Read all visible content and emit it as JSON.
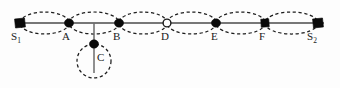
{
  "figure": {
    "background_color": "#fdfdfd",
    "axis_color": "#4a4a4a",
    "loop_color": "#1c1c1c",
    "node_color": "#0a0a0a",
    "axis_y": 23,
    "axis_x_start": 14,
    "axis_x_end": 326,
    "loop_count": 6
  },
  "points": [
    {
      "id": "S1",
      "label": "S",
      "sub": "1",
      "marker": "filled-square",
      "x": 20,
      "y": 23,
      "label_x": 12,
      "label_y": 30
    },
    {
      "id": "A",
      "label": "A",
      "sub": "",
      "marker": "filled-dot",
      "x": 69,
      "y": 23,
      "label_x": 62,
      "label_y": 30
    },
    {
      "id": "B",
      "label": "B",
      "sub": "",
      "marker": "filled-dot",
      "x": 119,
      "y": 23,
      "label_x": 113,
      "label_y": 30
    },
    {
      "id": "D",
      "label": "D",
      "sub": "",
      "marker": "open-circle",
      "x": 167,
      "y": 23,
      "label_x": 161,
      "label_y": 30
    },
    {
      "id": "E",
      "label": "E",
      "sub": "",
      "marker": "filled-dot",
      "x": 216,
      "y": 23,
      "label_x": 210,
      "label_y": 30
    },
    {
      "id": "F",
      "label": "F",
      "sub": "",
      "marker": "filled-square",
      "x": 265,
      "y": 23,
      "label_x": 259,
      "label_y": 30
    },
    {
      "id": "S2",
      "label": "S",
      "sub": "2",
      "marker": "filled-square",
      "x": 318,
      "y": 23,
      "label_x": 308,
      "label_y": 30
    },
    {
      "id": "C",
      "label": "C",
      "sub": "",
      "marker": "filled-dot",
      "x": 94,
      "y": 44,
      "label_x": 96,
      "label_y": 55
    }
  ],
  "loops": [
    {
      "id": "loop-s1-a",
      "from": "S1",
      "to": "A",
      "x1": 20,
      "x2": 69,
      "cy": 23,
      "ry": 11
    },
    {
      "id": "loop-a-b",
      "from": "A",
      "to": "B",
      "x1": 69,
      "x2": 119,
      "cy": 23,
      "ry": 11
    },
    {
      "id": "loop-b-d",
      "from": "B",
      "to": "D",
      "x1": 119,
      "x2": 167,
      "cy": 23,
      "ry": 11
    },
    {
      "id": "loop-d-e",
      "from": "D",
      "to": "E",
      "x1": 167,
      "x2": 216,
      "cy": 23,
      "ry": 11
    },
    {
      "id": "loop-e-f",
      "from": "E",
      "to": "F",
      "x1": 216,
      "x2": 265,
      "cy": 23,
      "ry": 11
    },
    {
      "id": "loop-f-s2",
      "from": "F",
      "to": "S2",
      "x1": 265,
      "x2": 318,
      "cy": 23,
      "ry": 11
    }
  ],
  "branch": {
    "id": "branch-to-c",
    "x": 94,
    "y_top": 23,
    "y_bottom": 73,
    "circle": {
      "cx": 94,
      "cy": 61,
      "r": 17
    }
  },
  "labels": {
    "s1": "S",
    "s1_sub": "1",
    "a": "A",
    "b": "B",
    "c": "C",
    "d": "D",
    "e": "E",
    "f": "F",
    "s2": "S",
    "s2_sub": "2"
  }
}
